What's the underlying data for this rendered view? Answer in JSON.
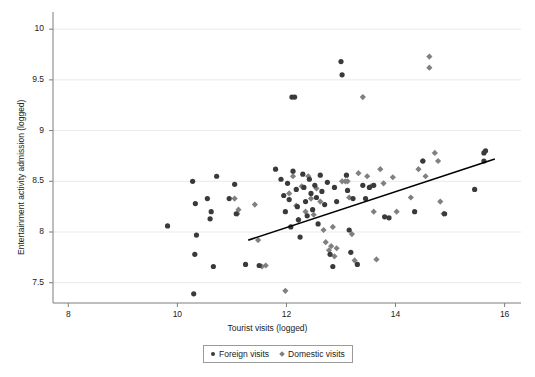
{
  "chart_data": {
    "type": "scatter",
    "title": "",
    "xlabel": "Tourist visits (logged)",
    "ylabel": "Entertainment activity admission (logged)",
    "xlim": [
      7.72,
      16.3
    ],
    "ylim": [
      7.3,
      10.12
    ],
    "xticks": [
      8,
      10,
      12,
      14,
      16
    ],
    "yticks": [
      7.5,
      8,
      8.5,
      9,
      9.5,
      10
    ],
    "xtick_labels": [
      "8",
      "10",
      "12",
      "14",
      "16"
    ],
    "ytick_labels": [
      "7.5",
      "8",
      "8.5",
      "9",
      "9.5",
      "10"
    ],
    "grid": "horizontal",
    "legend_position": "below-axes-center",
    "series": [
      {
        "name": "Foreign visits",
        "marker": "circle",
        "color": "#3a3a3a",
        "points": [
          [
            9.82,
            8.06
          ],
          [
            10.28,
            8.5
          ],
          [
            10.33,
            8.28
          ],
          [
            10.35,
            7.97
          ],
          [
            10.32,
            7.78
          ],
          [
            10.3,
            7.39
          ],
          [
            10.55,
            8.33
          ],
          [
            10.62,
            8.2
          ],
          [
            10.6,
            8.13
          ],
          [
            10.72,
            8.55
          ],
          [
            10.66,
            7.66
          ],
          [
            10.95,
            8.33
          ],
          [
            11.05,
            8.47
          ],
          [
            11.08,
            8.18
          ],
          [
            11.25,
            7.68
          ],
          [
            11.5,
            7.67
          ],
          [
            11.8,
            8.62
          ],
          [
            11.9,
            8.52
          ],
          [
            11.95,
            8.36
          ],
          [
            11.98,
            8.2
          ],
          [
            12.02,
            8.48
          ],
          [
            12.05,
            8.32
          ],
          [
            12.08,
            8.05
          ],
          [
            12.1,
            9.33
          ],
          [
            12.15,
            9.33
          ],
          [
            12.12,
            8.6
          ],
          [
            12.18,
            8.42
          ],
          [
            12.2,
            8.25
          ],
          [
            12.22,
            8.12
          ],
          [
            12.25,
            7.95
          ],
          [
            12.3,
            8.57
          ],
          [
            12.32,
            8.44
          ],
          [
            12.35,
            8.3
          ],
          [
            12.38,
            8.16
          ],
          [
            12.42,
            8.52
          ],
          [
            12.45,
            8.38
          ],
          [
            12.48,
            8.22
          ],
          [
            12.52,
            8.46
          ],
          [
            12.55,
            8.34
          ],
          [
            12.58,
            8.08
          ],
          [
            12.62,
            8.56
          ],
          [
            12.65,
            8.4
          ],
          [
            12.7,
            8.27
          ],
          [
            12.75,
            8.49
          ],
          [
            12.8,
            7.78
          ],
          [
            12.85,
            7.66
          ],
          [
            12.88,
            8.44
          ],
          [
            12.92,
            8.3
          ],
          [
            13.0,
            9.68
          ],
          [
            13.02,
            9.55
          ],
          [
            13.1,
            8.56
          ],
          [
            13.12,
            8.41
          ],
          [
            13.15,
            8.02
          ],
          [
            13.18,
            7.8
          ],
          [
            13.22,
            8.33
          ],
          [
            13.3,
            7.68
          ],
          [
            13.4,
            8.46
          ],
          [
            13.45,
            8.33
          ],
          [
            13.52,
            8.44
          ],
          [
            13.6,
            8.46
          ],
          [
            13.8,
            8.15
          ],
          [
            13.88,
            8.14
          ],
          [
            14.35,
            8.2
          ],
          [
            14.5,
            8.7
          ],
          [
            14.9,
            8.18
          ],
          [
            15.45,
            8.42
          ],
          [
            15.62,
            8.78
          ],
          [
            15.62,
            8.7
          ],
          [
            15.65,
            8.8
          ]
        ]
      },
      {
        "name": "Domestic visits",
        "marker": "diamond",
        "color": "#808080",
        "points": [
          [
            11.05,
            8.33
          ],
          [
            11.12,
            8.22
          ],
          [
            11.1,
            8.18
          ],
          [
            11.42,
            8.27
          ],
          [
            11.48,
            7.92
          ],
          [
            11.55,
            7.66
          ],
          [
            11.62,
            7.67
          ],
          [
            11.98,
            7.42
          ],
          [
            12.05,
            8.38
          ],
          [
            12.12,
            8.55
          ],
          [
            12.18,
            8.26
          ],
          [
            12.22,
            8.12
          ],
          [
            12.28,
            8.45
          ],
          [
            12.35,
            8.2
          ],
          [
            12.4,
            8.55
          ],
          [
            12.45,
            8.33
          ],
          [
            12.5,
            8.17
          ],
          [
            12.55,
            8.43
          ],
          [
            12.62,
            8.3
          ],
          [
            12.68,
            8.02
          ],
          [
            12.72,
            7.9
          ],
          [
            12.78,
            7.82
          ],
          [
            12.82,
            7.86
          ],
          [
            12.85,
            8.05
          ],
          [
            12.88,
            7.76
          ],
          [
            12.92,
            7.84
          ],
          [
            13.02,
            8.5
          ],
          [
            13.08,
            8.5
          ],
          [
            13.12,
            8.5
          ],
          [
            13.15,
            8.34
          ],
          [
            13.2,
            7.98
          ],
          [
            13.25,
            7.72
          ],
          [
            13.32,
            8.58
          ],
          [
            13.4,
            9.33
          ],
          [
            13.48,
            8.55
          ],
          [
            13.55,
            8.45
          ],
          [
            13.6,
            8.2
          ],
          [
            13.65,
            7.73
          ],
          [
            13.72,
            8.62
          ],
          [
            13.78,
            8.48
          ],
          [
            13.95,
            8.54
          ],
          [
            14.02,
            8.2
          ],
          [
            14.28,
            8.34
          ],
          [
            14.42,
            8.62
          ],
          [
            14.5,
            8.7
          ],
          [
            14.55,
            8.55
          ],
          [
            14.62,
            9.73
          ],
          [
            14.62,
            9.62
          ],
          [
            14.72,
            8.78
          ],
          [
            14.78,
            8.7
          ],
          [
            14.82,
            8.3
          ],
          [
            14.88,
            8.18
          ]
        ]
      }
    ],
    "fit_line": {
      "name": "linear fit",
      "color": "#000000",
      "x0": 11.3,
      "y0": 7.92,
      "x1": 15.82,
      "y1": 8.72
    },
    "legend": [
      {
        "label": "Foreign visits",
        "marker": "circle",
        "color": "#3a3a3a"
      },
      {
        "label": "Domestic visits",
        "marker": "diamond",
        "color": "#808080"
      }
    ]
  }
}
